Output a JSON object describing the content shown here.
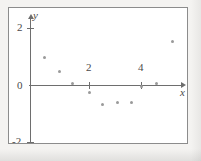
{
  "figure": {
    "background_color": "#f4f3f1",
    "plot_background_color": "#ffffff",
    "frame_color": "#8c8c8c",
    "axis_color": "#6e6e6e",
    "point_color": "#9a9a9a"
  },
  "chart_data": {
    "type": "scatter",
    "title": "",
    "subtitle": "",
    "xlabel": "x",
    "ylabel": "y",
    "xlim": [
      -0.3,
      5.7
    ],
    "ylim": [
      -2.3,
      2.4
    ],
    "grid": false,
    "legend": null,
    "xticks": [
      2,
      4
    ],
    "xtick_labels": [
      "2",
      "4"
    ],
    "yticks": [
      2,
      0,
      -2
    ],
    "ytick_labels": [
      "2",
      "0",
      "-2"
    ],
    "x": [
      0.27,
      0.85,
      1.38,
      2.0,
      2.5,
      3.08,
      3.65,
      4.0,
      4.58,
      5.23
    ],
    "y": [
      0.98,
      0.49,
      0.07,
      -0.28,
      -0.7,
      -0.6,
      -0.6,
      -0.07,
      0.04,
      1.51
    ],
    "points": [
      {
        "x": 0.27,
        "y": 0.98
      },
      {
        "x": 0.85,
        "y": 0.49
      },
      {
        "x": 1.38,
        "y": 0.07
      },
      {
        "x": 2.0,
        "y": -0.28
      },
      {
        "x": 2.5,
        "y": -0.7
      },
      {
        "x": 3.08,
        "y": -0.6
      },
      {
        "x": 3.65,
        "y": -0.6
      },
      {
        "x": 4.0,
        "y": -0.07
      },
      {
        "x": 4.58,
        "y": 0.04
      },
      {
        "x": 5.23,
        "y": 1.51
      }
    ],
    "annotations": []
  },
  "labels": {
    "x_axis_name": "x",
    "y_axis_name": "y",
    "xtick_2": "2",
    "xtick_4": "4",
    "ytick_2": "2",
    "ytick_0": "0",
    "ytick_neg2": "-2"
  }
}
